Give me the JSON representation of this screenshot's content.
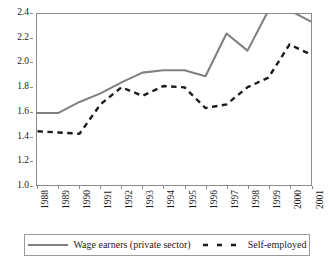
{
  "chart_data": {
    "type": "line",
    "title": "",
    "subtitle": "",
    "xlabel": "",
    "ylabel": "",
    "x": [
      "1988",
      "1989",
      "1990",
      "1991",
      "1992",
      "1993",
      "1994",
      "1995",
      "1996",
      "1997",
      "1998",
      "1999",
      "2000",
      "2001"
    ],
    "categories": [
      "1988",
      "1989",
      "1990",
      "1991",
      "1992",
      "1993",
      "1994",
      "1995",
      "1996",
      "1997",
      "1998",
      "1999",
      "2000",
      "2001"
    ],
    "series": [
      {
        "name": "Wage earners (private sector)",
        "style": "solid",
        "color": "#808080",
        "values": [
          1.59,
          1.59,
          1.68,
          1.75,
          1.84,
          1.92,
          1.94,
          1.94,
          1.89,
          2.24,
          2.1,
          2.43,
          2.43,
          2.34
        ]
      },
      {
        "name": "Self-employed",
        "style": "dashed",
        "color": "#1a1a1a",
        "values": [
          1.44,
          1.43,
          1.42,
          1.66,
          1.8,
          1.73,
          1.81,
          1.8,
          1.63,
          1.66,
          1.8,
          1.88,
          2.15,
          2.07
        ]
      }
    ],
    "ylim": [
      1.0,
      2.4
    ],
    "yticks": [
      "1.0",
      "1.2",
      "1.4",
      "1.6",
      "1.8",
      "2.0",
      "2.2",
      "2.4"
    ],
    "ytick_values": [
      1.0,
      1.2,
      1.4,
      1.6,
      1.8,
      2.0,
      2.2,
      2.4
    ],
    "xlim": [
      "1988",
      "2001"
    ],
    "grid": false,
    "legend_position": "bottom",
    "frame": true
  },
  "axes": {
    "y": {
      "ticks": [
        {
          "label": "2.4",
          "value": 2.4
        },
        {
          "label": "2.2",
          "value": 2.2
        },
        {
          "label": "2.0",
          "value": 2.0
        },
        {
          "label": "1.8",
          "value": 1.8
        },
        {
          "label": "1.6",
          "value": 1.6
        },
        {
          "label": "1.4",
          "value": 1.4
        },
        {
          "label": "1.2",
          "value": 1.2
        },
        {
          "label": "1.0",
          "value": 1.0
        }
      ]
    },
    "x": {
      "ticks": [
        {
          "label": "1988"
        },
        {
          "label": "1989"
        },
        {
          "label": "1990"
        },
        {
          "label": "1991"
        },
        {
          "label": "1992"
        },
        {
          "label": "1993"
        },
        {
          "label": "1994"
        },
        {
          "label": "1995"
        },
        {
          "label": "1996"
        },
        {
          "label": "1997"
        },
        {
          "label": "1998"
        },
        {
          "label": "1999"
        },
        {
          "label": "2000"
        },
        {
          "label": "2001"
        }
      ]
    }
  },
  "legend": {
    "entries": [
      {
        "label": "Wage earners (private sector)",
        "color": "#808080",
        "style": "solid"
      },
      {
        "label": "Self-employed",
        "color": "#1a1a1a",
        "style": "dashed"
      }
    ]
  }
}
